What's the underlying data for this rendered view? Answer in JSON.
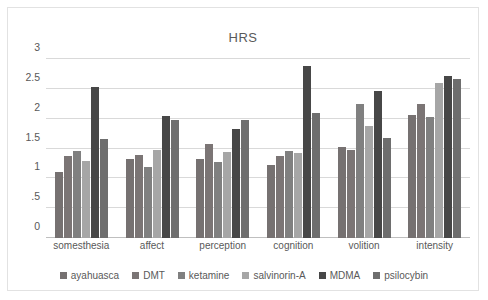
{
  "chart_data": {
    "type": "bar",
    "title": "HRS",
    "xlabel": "",
    "ylabel": "",
    "ylim": [
      0,
      3
    ],
    "yticks": [
      "0",
      ".5",
      "1",
      "1.5",
      "2",
      "2.5",
      "3"
    ],
    "ytick_values": [
      0,
      0.5,
      1,
      1.5,
      2,
      2.5,
      3
    ],
    "grid": true,
    "legend_position": "bottom",
    "categories": [
      "somesthesia",
      "affect",
      "perception",
      "cognition",
      "volition",
      "intensity"
    ],
    "series": [
      {
        "name": "ayahuasca",
        "color": "#767171",
        "values": [
          1.1,
          1.32,
          1.33,
          1.23,
          1.52,
          2.07
        ]
      },
      {
        "name": "DMT",
        "color": "#7b7575",
        "values": [
          1.37,
          1.39,
          1.57,
          1.37,
          1.47,
          2.24
        ]
      },
      {
        "name": "ketamine",
        "color": "#808080",
        "values": [
          1.46,
          1.19,
          1.27,
          1.45,
          2.25,
          2.02
        ]
      },
      {
        "name": "salvinorin-A",
        "color": "#a6a6a6",
        "values": [
          1.29,
          1.48,
          1.44,
          1.42,
          1.88,
          2.6
        ]
      },
      {
        "name": "MDMA",
        "color": "#474747",
        "values": [
          2.53,
          2.04,
          1.83,
          2.88,
          2.47,
          2.72
        ]
      },
      {
        "name": "psilocybin",
        "color": "#6e6e6e",
        "values": [
          1.66,
          1.97,
          1.98,
          2.1,
          1.68,
          2.67
        ]
      }
    ]
  }
}
